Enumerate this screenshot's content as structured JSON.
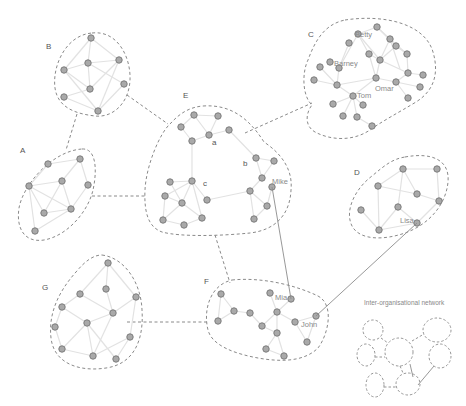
{
  "diagram": {
    "type": "social-network-clusters",
    "colors": {
      "background": "#ffffff",
      "node_fill": "#a9a9a9",
      "node_stroke": "#7d7d7d",
      "intra_edge": "#e2e2e2",
      "hull_dashed": "#8a8a8a",
      "person_tie": "#8c8c8c",
      "label_text": "#555555"
    },
    "clusters": [
      {
        "id": "A",
        "label": "A",
        "label_pos": [
          22,
          151
        ],
        "node_count": 7
      },
      {
        "id": "B",
        "label": "B",
        "label_pos": [
          48,
          46
        ],
        "node_count": 7
      },
      {
        "id": "C",
        "label": "C",
        "label_pos": [
          308,
          37
        ],
        "node_count": 30
      },
      {
        "id": "D",
        "label": "D",
        "label_pos": [
          355,
          173
        ],
        "node_count": 9
      },
      {
        "id": "E",
        "label": "E",
        "label_pos": [
          183,
          95
        ],
        "node_count": 25
      },
      {
        "id": "F",
        "label": "F",
        "label_pos": [
          205,
          283
        ],
        "node_count": 13
      },
      {
        "id": "G",
        "label": "G",
        "label_pos": [
          43,
          288
        ],
        "node_count": 12
      }
    ],
    "subgroup_labels": [
      {
        "text": "a",
        "pos": [
          212,
          144
        ]
      },
      {
        "text": "b",
        "pos": [
          243,
          164
        ]
      },
      {
        "text": "c",
        "pos": [
          203,
          184
        ]
      }
    ],
    "person_labels": [
      {
        "text": "Betty",
        "pos": [
          355,
          36
        ]
      },
      {
        "text": "Barney",
        "pos": [
          334,
          65
        ]
      },
      {
        "text": "Omar",
        "pos": [
          375,
          90
        ]
      },
      {
        "text": "Tom",
        "pos": [
          357,
          97
        ]
      },
      {
        "text": "Mike",
        "pos": [
          272,
          184
        ]
      },
      {
        "text": "Lisa",
        "pos": [
          400,
          222
        ]
      },
      {
        "text": "Mia",
        "pos": [
          276,
          298
        ]
      },
      {
        "text": "John",
        "pos": [
          301,
          324
        ]
      }
    ],
    "inter_person_ties": [
      {
        "from": "Mike",
        "to": "Mia"
      },
      {
        "from": "Lisa",
        "to": "John"
      }
    ],
    "cluster_bridges": [
      [
        "B",
        "A"
      ],
      [
        "B",
        "E"
      ],
      [
        "E",
        "C"
      ],
      [
        "A",
        "E"
      ],
      [
        "E",
        "F"
      ],
      [
        "G",
        "F"
      ]
    ],
    "legend": {
      "title": "Inter-organisational network"
    }
  }
}
